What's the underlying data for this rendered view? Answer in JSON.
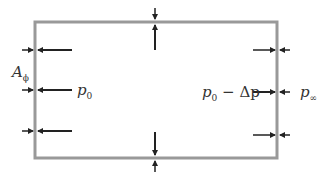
{
  "diagram": {
    "type": "control-volume-pressure-diagram",
    "box_color": "#999999",
    "arrow_color": "#222222",
    "labels": {
      "area": {
        "main": "A",
        "sub": "ϕ"
      },
      "inner_left_pressure": {
        "main": "p",
        "sub": "0"
      },
      "inner_right_pressure": {
        "main": "p",
        "sub": "0",
        "suffix": " − Δp"
      },
      "outer_right_pressure": {
        "main": "p",
        "sub": "∞"
      }
    }
  }
}
